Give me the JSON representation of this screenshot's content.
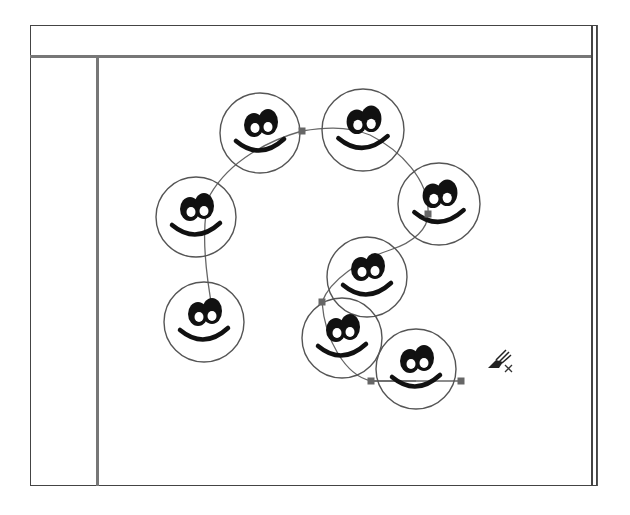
{
  "window": {
    "header_title": "",
    "ruler_visible": true
  },
  "canvas": {
    "stroke_color": "#555555",
    "fill_color": "#ffffff",
    "face_feature_color": "#111111",
    "handle_color": "#666666",
    "faces": [
      {
        "id": "face-1",
        "cx": 260,
        "cy": 133,
        "r": 40
      },
      {
        "id": "face-2",
        "cx": 363,
        "cy": 130,
        "r": 41
      },
      {
        "id": "face-3",
        "cx": 196,
        "cy": 217,
        "r": 40
      },
      {
        "id": "face-4",
        "cx": 204,
        "cy": 322,
        "r": 40
      },
      {
        "id": "face-5",
        "cx": 439,
        "cy": 204,
        "r": 41
      },
      {
        "id": "face-6",
        "cx": 367,
        "cy": 277,
        "r": 40
      },
      {
        "id": "face-7",
        "cx": 342,
        "cy": 338,
        "r": 40
      },
      {
        "id": "face-8",
        "cx": 416,
        "cy": 369,
        "r": 40
      }
    ],
    "path_handles": [
      {
        "x": 302,
        "y": 131
      },
      {
        "x": 428,
        "y": 214
      },
      {
        "x": 322,
        "y": 302
      },
      {
        "x": 371,
        "y": 381
      },
      {
        "x": 461,
        "y": 381
      }
    ]
  },
  "cursor": {
    "icon": "spray-brush-delete-cursor",
    "x": 497,
    "y": 358
  }
}
